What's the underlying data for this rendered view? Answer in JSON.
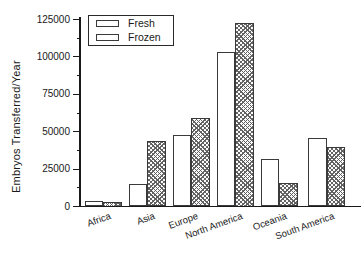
{
  "figure": {
    "width_px": 362,
    "height_px": 259,
    "background": "#ffffff"
  },
  "colors": {
    "axis": "#1a1a1a",
    "text": "#1a1a1a",
    "bar_border": "#3a3a3a",
    "fresh_fill": "#ffffff",
    "frozen_hatch_gray": "#5c5c5c"
  },
  "chart_data": {
    "type": "bar",
    "title": "",
    "xlabel": "",
    "ylabel": "Embryos Transferred/Year",
    "categories": [
      "Africa",
      "Asia",
      "Europe",
      "North America",
      "Oceania",
      "South America"
    ],
    "series": [
      {
        "name": "Fresh",
        "style": "solid-white",
        "values": [
          3500,
          15000,
          48000,
          103000,
          32000,
          46000
        ]
      },
      {
        "name": "Frozen",
        "style": "gray-crosshatch",
        "values": [
          3000,
          44000,
          59000,
          123000,
          15500,
          39500
        ]
      }
    ],
    "ylim": [
      0,
      125000
    ],
    "yticks": [
      0,
      25000,
      50000,
      75000,
      100000,
      125000
    ],
    "minor_yticks": [
      12500,
      37500,
      62500,
      87500,
      112500
    ],
    "grid": false,
    "legend_position": "top-left",
    "x_tick_label_rotation_deg": -20
  }
}
